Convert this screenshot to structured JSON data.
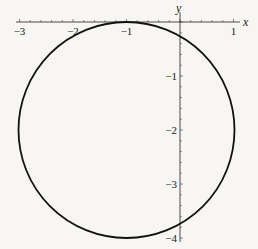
{
  "chart_data": {
    "type": "line",
    "title": "",
    "xlabel": "x",
    "ylabel": "y",
    "xlim": [
      -3.05,
      1.1
    ],
    "ylim": [
      -4.05,
      0.3
    ],
    "grid": false,
    "legend": null,
    "x_ticks": [
      -3,
      -2,
      -1,
      1
    ],
    "x_tick_labels": [
      "−3",
      "−2",
      "−1",
      "1"
    ],
    "y_ticks": [
      -1,
      -2,
      -3,
      -4
    ],
    "y_tick_labels": [
      "−1",
      "−2",
      "−3",
      "−4"
    ],
    "series": [
      {
        "name": "circle",
        "shape": "circle",
        "center": [
          -1,
          -2
        ],
        "radius": 2,
        "equation": "(x+1)^2 + (y+2)^2 = 4",
        "color": "#111111"
      }
    ]
  },
  "axes": {
    "x_label": "x",
    "y_label": "y"
  }
}
